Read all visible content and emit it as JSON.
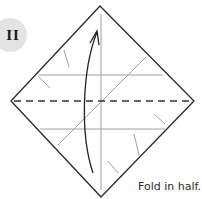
{
  "step": {
    "number_label": "II",
    "caption": "Fold in half."
  },
  "diagram": {
    "shape": "square-diamond",
    "corners": {
      "top": [
        100,
        6
      ],
      "right": [
        194,
        101
      ],
      "bottom": [
        101,
        197
      ],
      "left": [
        11,
        101
      ]
    },
    "fold_line": "horizontal-dashed-valley",
    "arrow_direction": "bottom-to-top",
    "colors": {
      "outline": "#2a2a2a",
      "crease": "#9a9a9a",
      "dashed": "#333333",
      "arrow": "#222222",
      "badge_bg": "#e3e3e3"
    }
  }
}
